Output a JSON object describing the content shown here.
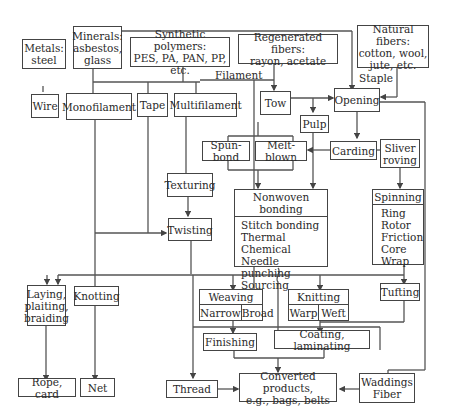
{
  "sources": {
    "metals": [
      "Metals:",
      "steel"
    ],
    "minerals": [
      "Minerals:",
      "asbestos,",
      "glass"
    ],
    "synthetic": [
      "Synthetic polymers:",
      "PES, PA, PAN, PP, etc."
    ],
    "regenerated": [
      "Regenerated fibers:",
      "rayon, acetate"
    ],
    "natural": [
      "Natural fibers:",
      "cotton, wool,",
      "jute, etc."
    ]
  },
  "labels": {
    "filament": "Filament",
    "staple": "Staple"
  },
  "nodes": {
    "wire": "Wire",
    "monofilament": "Monofilament",
    "tape": "Tape",
    "multifilament": "Multifilament",
    "tow": "Tow",
    "opening": "Opening",
    "pulp": "Pulp",
    "spun_bond": "Spun-bond",
    "melt_blown": "Melt-blown",
    "carding": "Carding",
    "sliver_roving": [
      "Sliver",
      "roving"
    ],
    "texturing": "Texturing",
    "twisting": "Twisting",
    "nonwoven": {
      "title": "Nonwoven bonding",
      "items": [
        "Stitch bonding",
        "Thermal",
        "Chemical",
        "Needle punching",
        "Sourcing"
      ]
    },
    "spinning": {
      "title": "Spinning",
      "items": [
        "Ring",
        "Rotor",
        "Friction",
        "Core",
        "Wrap"
      ]
    },
    "laying": [
      "Laying,",
      "plaiting,",
      "braiding"
    ],
    "knotting": "Knotting",
    "weaving": {
      "title": "Weaving",
      "cols": [
        "Narrow",
        "Broad"
      ]
    },
    "knitting": {
      "title": "Knitting",
      "cols": [
        "Warp",
        "Weft"
      ]
    },
    "tufting": "Tufting",
    "finishing": "Finishing",
    "coating": "Coating, laminating",
    "rope": "Rope, card",
    "net": "Net",
    "thread": "Thread",
    "converted": [
      "Converted products,",
      "e.g., bags, belts"
    ],
    "waddings": [
      "Waddings",
      "Fiber"
    ]
  },
  "colors": {
    "line": "#444444",
    "text": "#2a2a2a",
    "background": "#ffffff"
  }
}
